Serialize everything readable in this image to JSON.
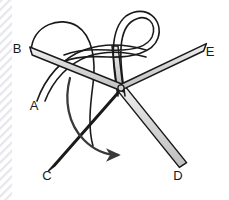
{
  "figure": {
    "background_color": "#ffffff",
    "width": 229,
    "height": 200,
    "colors": {
      "rod_fill_light": "#d9d9d9",
      "rod_fill_mid": "#c4c4c4",
      "rod_outline": "#1a1a1a",
      "thread_stroke": "#1a1a1a",
      "thread_fill": "#ffffff",
      "arrow_color": "#3a3a3a",
      "label_color": "#1a1a1a",
      "edge_texture_color": "#e8e8ec"
    },
    "edge_texture": {
      "name": "left-edge-stripes",
      "x": 0,
      "width": 12,
      "stripe_angle_deg": 45
    },
    "labels": [
      {
        "id": "label-b",
        "text": "B",
        "x": 17,
        "y": 53
      },
      {
        "id": "label-a",
        "text": "A",
        "x": 34,
        "y": 110
      },
      {
        "id": "label-c",
        "text": "C",
        "x": 47,
        "y": 180
      },
      {
        "id": "label-d",
        "text": "D",
        "x": 178,
        "y": 180
      },
      {
        "id": "label-e",
        "text": "E",
        "x": 210,
        "y": 56
      }
    ],
    "rods": [
      {
        "id": "rod-b-center",
        "label": "B",
        "from": [
          31,
          51
        ],
        "to": [
          122,
          88
        ],
        "half_width": 4.2
      },
      {
        "id": "rod-center-e",
        "label": "E",
        "from": [
          122,
          88
        ],
        "to": [
          205,
          47
        ],
        "half_width": 4.2
      },
      {
        "id": "rod-c-center",
        "label": "C",
        "from": [
          52,
          168
        ],
        "to": [
          124,
          86
        ],
        "half_width": 4.0
      },
      {
        "id": "rod-center-d",
        "label": "D",
        "from": [
          121,
          88
        ],
        "to": [
          183,
          165
        ],
        "half_width": 3.6
      },
      {
        "id": "rod-center-up",
        "label": "",
        "from": [
          120,
          88
        ],
        "to": [
          115,
          48
        ],
        "half_width": 3.0
      }
    ],
    "threads": [
      {
        "id": "thread-a-strand",
        "description": "suture strand A running from lower left up over the rods"
      },
      {
        "id": "thread-b-arc",
        "description": "suture arc looping over the B rod"
      },
      {
        "id": "thread-top-loop",
        "description": "looped coil of suture at top around the central post"
      }
    ],
    "arrow": {
      "id": "motion-arrow",
      "description": "curved arrow indicating direction of throw",
      "tip": [
        124,
        155
      ]
    }
  }
}
